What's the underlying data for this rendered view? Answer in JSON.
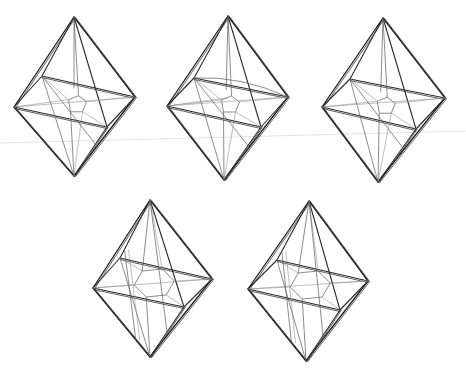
{
  "figure": {
    "title": "",
    "count": 5,
    "ink_color": "#1e1e1e",
    "background_color": "#ffffff",
    "items": [
      {
        "id": "octahedron-1",
        "variant": "inner star with pentagonal center"
      },
      {
        "id": "octahedron-2",
        "variant": "inner star with curved upper arcs"
      },
      {
        "id": "octahedron-3",
        "variant": "inner star with pentagonal center"
      },
      {
        "id": "octahedron-4",
        "variant": "inner hexagonal ring"
      },
      {
        "id": "octahedron-5",
        "variant": "inner hexagonal ring"
      }
    ]
  }
}
